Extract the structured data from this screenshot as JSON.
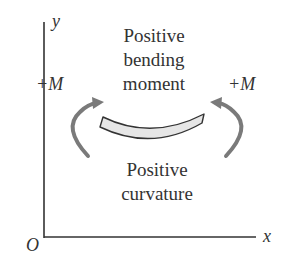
{
  "diagram": {
    "axes": {
      "y_label": "y",
      "x_label": "x",
      "origin_label": "O"
    },
    "top_text": {
      "line1": "Positive",
      "line2": "bending",
      "line3": "moment"
    },
    "bottom_text": {
      "line1": "Positive",
      "line2": "curvature"
    },
    "moment_left": "+M",
    "moment_right": "+M",
    "colors": {
      "axis": "#333333",
      "text": "#333333",
      "arrow": "#7a7a7a",
      "beam_fill": "#e6e6e6",
      "beam_stroke": "#333333"
    }
  }
}
